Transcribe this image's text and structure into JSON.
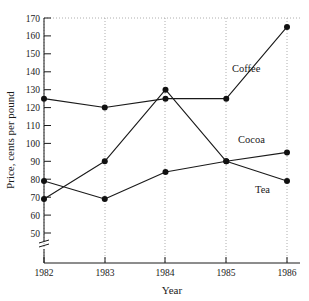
{
  "chart_data": {
    "type": "line",
    "title": "",
    "xlabel": "Year",
    "ylabel": "Price, cents per pound",
    "x": [
      1982,
      1983,
      1984,
      1985,
      1986
    ],
    "xtick_labels": [
      "1982",
      "1983",
      "1984",
      "1985",
      "1986"
    ],
    "ytick_labels": [
      "50",
      "60",
      "70",
      "80",
      "90",
      "100",
      "110",
      "120",
      "130",
      "140",
      "150",
      "160",
      "170"
    ],
    "ytick_values": [
      50,
      60,
      70,
      80,
      90,
      100,
      110,
      120,
      130,
      140,
      150,
      160,
      170
    ],
    "ylim": [
      50,
      170
    ],
    "xlim": [
      1982,
      1986
    ],
    "y_axis_break": true,
    "y_axis_break_note": "axis broken below 50",
    "grid": "vertical dotted gridlines at each year; dotted line along top at 170",
    "legend_position": "inline end-of-line labels",
    "series": [
      {
        "name": "Coffee",
        "values": [
          125,
          120,
          125,
          125,
          165
        ],
        "label": "Coffee",
        "label_x": 1985.15,
        "label_y": 140,
        "color": "#1a1a1a",
        "marker": "filled-circle"
      },
      {
        "name": "Cocoa",
        "values": [
          69,
          90,
          130,
          90,
          95
        ],
        "label": "Cocoa",
        "label_x": 1985.3,
        "label_y": 101,
        "color": "#1a1a1a",
        "marker": "filled-circle"
      },
      {
        "name": "Tea",
        "values": [
          79,
          69,
          84,
          90,
          79
        ],
        "label": "Tea",
        "label_x": 1985.45,
        "label_y": 73,
        "color": "#1a1a1a",
        "marker": "filled-circle"
      }
    ]
  },
  "axes": {
    "x_title": "Year",
    "y_title": "Price, cents per pound"
  },
  "colors": {
    "ink": "#1a1a1a",
    "grid": "#999999",
    "background": "#ffffff"
  }
}
